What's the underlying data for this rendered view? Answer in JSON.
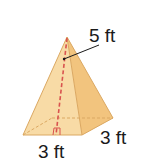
{
  "figure": {
    "type": "square pyramid",
    "labels": {
      "slant_height": "5 ft",
      "base_front": "3 ft",
      "base_side": "3 ft"
    },
    "colors": {
      "face_light": "#f8d9a0",
      "face_dark": "#f0c27a",
      "edge": "#d9a45a",
      "height_line": "#d9534f",
      "leader": "#1a1a1a"
    }
  }
}
